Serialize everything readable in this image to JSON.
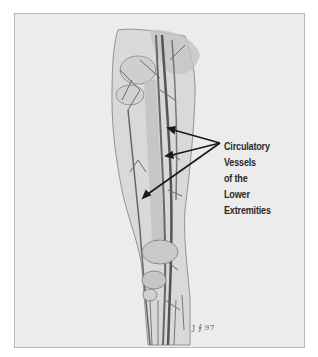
{
  "figure": {
    "title": "Circulatory Vessels of the Lower Extremities",
    "label_lines": [
      "Circulatory",
      "Vessels",
      "of the",
      "Lower",
      "Extremities"
    ],
    "signature": "J ∮ 97",
    "arrow_count": 3,
    "colors": {
      "background": "#ececec",
      "border": "#b8b8b8",
      "ink": "#2a2a2a",
      "vessel": "#555555"
    }
  }
}
